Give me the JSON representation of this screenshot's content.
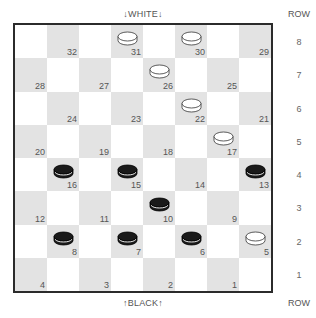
{
  "labels": {
    "top": "↓WHITE↓",
    "bottom": "↑BLACK↑",
    "row_header": "ROW"
  },
  "rows": [
    "8",
    "7",
    "6",
    "5",
    "4",
    "3",
    "2",
    "1"
  ],
  "colors": {
    "dark_square": "#e3e3e3",
    "light_square": "#ffffff",
    "border": "#2b2b2b",
    "black_piece": "#1a1a1a",
    "white_piece": "#ffffff"
  },
  "squares": [
    {
      "num": "32",
      "row": 0,
      "col": 1,
      "piece": null
    },
    {
      "num": "31",
      "row": 0,
      "col": 3,
      "piece": "white"
    },
    {
      "num": "30",
      "row": 0,
      "col": 5,
      "piece": "white"
    },
    {
      "num": "29",
      "row": 0,
      "col": 7,
      "piece": null
    },
    {
      "num": "28",
      "row": 1,
      "col": 0,
      "piece": null
    },
    {
      "num": "27",
      "row": 1,
      "col": 2,
      "piece": null
    },
    {
      "num": "26",
      "row": 1,
      "col": 4,
      "piece": "white"
    },
    {
      "num": "25",
      "row": 1,
      "col": 6,
      "piece": null
    },
    {
      "num": "24",
      "row": 2,
      "col": 1,
      "piece": null
    },
    {
      "num": "23",
      "row": 2,
      "col": 3,
      "piece": null
    },
    {
      "num": "22",
      "row": 2,
      "col": 5,
      "piece": "white"
    },
    {
      "num": "21",
      "row": 2,
      "col": 7,
      "piece": null
    },
    {
      "num": "20",
      "row": 3,
      "col": 0,
      "piece": null
    },
    {
      "num": "19",
      "row": 3,
      "col": 2,
      "piece": null
    },
    {
      "num": "18",
      "row": 3,
      "col": 4,
      "piece": null
    },
    {
      "num": "17",
      "row": 3,
      "col": 6,
      "piece": "white"
    },
    {
      "num": "16",
      "row": 4,
      "col": 1,
      "piece": "black"
    },
    {
      "num": "15",
      "row": 4,
      "col": 3,
      "piece": "black"
    },
    {
      "num": "14",
      "row": 4,
      "col": 5,
      "piece": null
    },
    {
      "num": "13",
      "row": 4,
      "col": 7,
      "piece": "black"
    },
    {
      "num": "12",
      "row": 5,
      "col": 0,
      "piece": null
    },
    {
      "num": "11",
      "row": 5,
      "col": 2,
      "piece": null
    },
    {
      "num": "10",
      "row": 5,
      "col": 4,
      "piece": "black"
    },
    {
      "num": "9",
      "row": 5,
      "col": 6,
      "piece": null
    },
    {
      "num": "8",
      "row": 6,
      "col": 1,
      "piece": "black"
    },
    {
      "num": "7",
      "row": 6,
      "col": 3,
      "piece": "black"
    },
    {
      "num": "6",
      "row": 6,
      "col": 5,
      "piece": "black"
    },
    {
      "num": "5",
      "row": 6,
      "col": 7,
      "piece": "white"
    },
    {
      "num": "4",
      "row": 7,
      "col": 0,
      "piece": null
    },
    {
      "num": "3",
      "row": 7,
      "col": 2,
      "piece": null
    },
    {
      "num": "2",
      "row": 7,
      "col": 4,
      "piece": null
    },
    {
      "num": "1",
      "row": 7,
      "col": 6,
      "piece": null
    }
  ]
}
